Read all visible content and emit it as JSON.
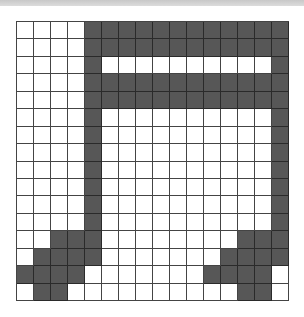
{
  "board": {
    "cols": 16,
    "rows": 16,
    "colors": {
      "filled": "#575757",
      "empty": "#ffffff",
      "grid_line": "#444444"
    },
    "pattern": [
      "0000111111111111",
      "0000111111111111",
      "0000100000000001",
      "0000111111111111",
      "0000111111111111",
      "0000100000000001",
      "0000100000000001",
      "0000100000000001",
      "0000100000000001",
      "0000100000000001",
      "0000100000000001",
      "0000100000000001",
      "0011100000000111",
      "0111100000001111",
      "1111000000011110",
      "0110000000000110"
    ]
  }
}
